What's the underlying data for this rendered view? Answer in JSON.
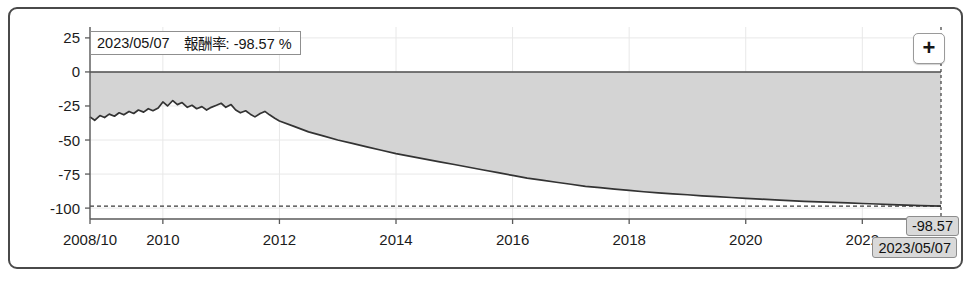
{
  "widget": {
    "name": "return-rate-area-chart"
  },
  "tooltip": {
    "date": "2023/05/07",
    "metric_value": "報酬率: -98.57 %"
  },
  "controls": {
    "zoom_in_label": "+"
  },
  "cursor": {
    "value_tag": "-98.57",
    "date_tag": "2023/05/07"
  },
  "chart_data": {
    "type": "area",
    "title": "",
    "xlabel": "",
    "ylabel": "",
    "ylim": [
      -108,
      33
    ],
    "xlim": [
      2008.75,
      2023.35
    ],
    "grid": true,
    "legend": false,
    "y_ticks": [
      25,
      0,
      -25,
      -50,
      -75,
      -100
    ],
    "y_tick_labels": [
      "25",
      "0",
      "-25",
      "-50",
      "-75",
      "-100"
    ],
    "x_ticks": [
      2008.75,
      2010,
      2012,
      2014,
      2016,
      2018,
      2020,
      2022
    ],
    "x_tick_labels": [
      "2008/10",
      "2010",
      "2012",
      "2014",
      "2016",
      "2018",
      "2020",
      "2022"
    ],
    "zero_line": 0,
    "reference_line": {
      "value": -98.57,
      "style": "dashed",
      "label": "-98.57"
    },
    "cursor_line": {
      "x": 2023.35,
      "style": "dashed"
    },
    "fill_color": "#d4d4d4",
    "line_color": "#333333",
    "series": [
      {
        "name": "報酬率",
        "unit": "%",
        "x": [
          2008.75,
          2008.83,
          2008.92,
          2009.0,
          2009.08,
          2009.17,
          2009.25,
          2009.33,
          2009.42,
          2009.5,
          2009.58,
          2009.67,
          2009.75,
          2009.83,
          2009.92,
          2010.0,
          2010.08,
          2010.17,
          2010.25,
          2010.33,
          2010.42,
          2010.5,
          2010.58,
          2010.67,
          2010.75,
          2010.83,
          2010.92,
          2011.0,
          2011.08,
          2011.17,
          2011.25,
          2011.33,
          2011.42,
          2011.5,
          2011.58,
          2011.67,
          2011.75,
          2011.83,
          2011.92,
          2012.0,
          2012.25,
          2012.5,
          2012.75,
          2013.0,
          2013.25,
          2013.5,
          2013.75,
          2014.0,
          2014.25,
          2014.5,
          2014.75,
          2015.0,
          2015.25,
          2015.5,
          2015.75,
          2016.0,
          2016.25,
          2016.5,
          2016.75,
          2017.0,
          2017.25,
          2017.5,
          2017.75,
          2018.0,
          2018.25,
          2018.5,
          2018.75,
          2019.0,
          2019.25,
          2019.5,
          2019.75,
          2020.0,
          2020.25,
          2020.5,
          2020.75,
          2021.0,
          2021.25,
          2021.5,
          2021.75,
          2022.0,
          2022.25,
          2022.5,
          2022.75,
          2023.0,
          2023.35
        ],
        "values": [
          -33.0,
          -35.5,
          -32.0,
          -33.5,
          -31.0,
          -32.5,
          -30.0,
          -31.5,
          -29.0,
          -30.5,
          -28.0,
          -29.5,
          -27.0,
          -28.5,
          -26.5,
          -22.0,
          -25.0,
          -21.0,
          -24.0,
          -22.5,
          -26.0,
          -24.5,
          -27.0,
          -25.5,
          -28.0,
          -26.0,
          -24.5,
          -23.0,
          -26.0,
          -24.0,
          -28.0,
          -30.0,
          -28.5,
          -31.0,
          -33.0,
          -30.5,
          -29.0,
          -31.5,
          -34.0,
          -36.0,
          -40.0,
          -44.0,
          -47.0,
          -50.0,
          -52.5,
          -55.0,
          -57.5,
          -60.0,
          -62.0,
          -64.0,
          -66.0,
          -68.0,
          -70.0,
          -72.0,
          -74.0,
          -76.0,
          -78.0,
          -79.5,
          -81.0,
          -82.5,
          -84.0,
          -85.0,
          -86.0,
          -87.0,
          -88.0,
          -88.8,
          -89.5,
          -90.2,
          -91.0,
          -91.6,
          -92.2,
          -92.8,
          -93.4,
          -94.0,
          -94.5,
          -95.0,
          -95.4,
          -95.8,
          -96.2,
          -96.6,
          -97.0,
          -97.4,
          -97.8,
          -98.2,
          -98.57
        ]
      }
    ]
  }
}
